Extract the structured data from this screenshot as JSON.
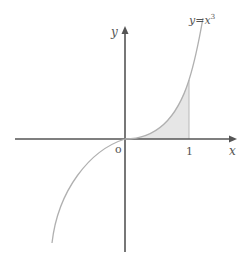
{
  "diagram": {
    "function_label": "y = x³",
    "function_label_base": "y=x",
    "function_label_exp": "3",
    "x_axis_label": "x",
    "y_axis_label": "y",
    "origin_label": "o",
    "tick_x_1": "1",
    "shaded_region": "area under y=x^3 from x=0 to x=1",
    "colors": {
      "axes": "#555555",
      "curve": "#b0b0b0",
      "shade": "#e6e6e6",
      "text": "#555555"
    }
  }
}
